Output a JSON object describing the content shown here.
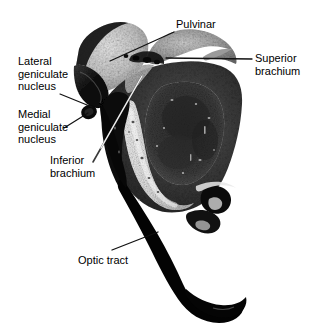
{
  "figure": {
    "background_color": "#ffffff",
    "width": 312,
    "height": 332,
    "label_text_color": "#000000",
    "leader_dark_color": "#1a1a1a",
    "leader_light_color": "#f2f2f2"
  },
  "labels": [
    {
      "id": "pulvinar",
      "text": "Pulvinar",
      "x": 176,
      "y": 18,
      "leader_color": "#111111",
      "leader": [
        [
          174,
          32
        ],
        [
          110,
          61
        ]
      ]
    },
    {
      "id": "superior-brachium",
      "text": "Superior\nbrachium",
      "x": 255,
      "y": 52,
      "leader_color": "#111111",
      "leader": [
        [
          252,
          59
        ],
        [
          166,
          58
        ]
      ]
    },
    {
      "id": "lateral-geniculate-nucleus",
      "text": "Lateral\ngeniculate\nnucleus",
      "x": 18,
      "y": 55,
      "leader_color": "#111111",
      "leader": [
        [
          60,
          94
        ],
        [
          90,
          106
        ]
      ]
    },
    {
      "id": "medial-geniculate-nucleus",
      "text": "Medial\ngeniculate\nnucleus",
      "x": 18,
      "y": 108,
      "leader_color": "#111111",
      "leader": [
        [
          66,
          126
        ],
        [
          88,
          112
        ]
      ]
    },
    {
      "id": "inferior-brachium",
      "text": "Inferior\nbrachium",
      "x": 50,
      "y": 154,
      "leader_color": "#2a2a2a",
      "leader": [
        [
          93,
          162
        ],
        [
          142,
          76
        ]
      ]
    },
    {
      "id": "optic-tract",
      "text": "Optic tract",
      "x": 78,
      "y": 254,
      "leader_color": "#111111",
      "leader": [
        [
          112,
          250
        ],
        [
          158,
          232
        ]
      ]
    }
  ],
  "structures": [
    {
      "id": "pulvinar-body",
      "name": "pulvinar",
      "tone": "light-gray"
    },
    {
      "id": "lateral-geniculate-body",
      "name": "lateral geniculate nucleus",
      "tone": "dark"
    },
    {
      "id": "medial-geniculate-body",
      "name": "medial geniculate nucleus",
      "tone": "dark"
    },
    {
      "id": "superior-colliculus",
      "name": "superior colliculus / superior brachium",
      "tone": "mid-gray"
    },
    {
      "id": "inferior-brachium-band",
      "name": "inferior brachium",
      "tone": "light-band"
    },
    {
      "id": "midbrain-body",
      "name": "midbrain tegmentum",
      "tone": "mottled"
    },
    {
      "id": "optic-tract-band",
      "name": "optic tract",
      "tone": "black"
    }
  ]
}
